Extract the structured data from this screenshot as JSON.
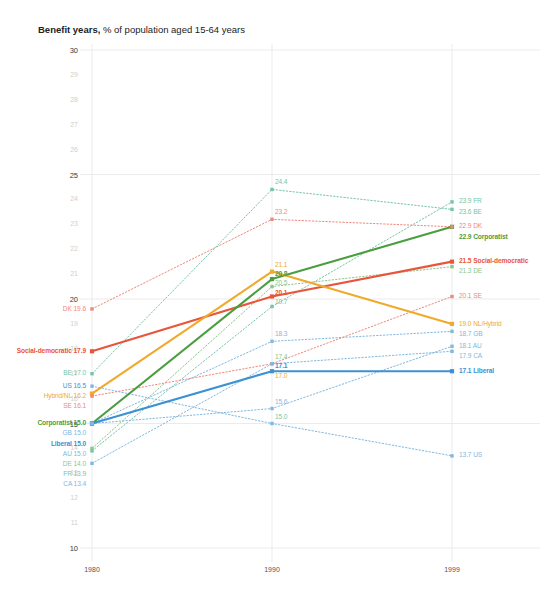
{
  "title": {
    "bold": "Benefit years,",
    "regular": " % of population aged 15-64 years"
  },
  "axes": {
    "x_ticks": [
      "1980",
      "1990",
      "1999"
    ],
    "y_ticks": [
      "30",
      "29",
      "28",
      "27",
      "26",
      "25",
      "24",
      "23",
      "22",
      "21",
      "20",
      "19",
      "18",
      "17",
      "16",
      "15",
      "14",
      "13",
      "12",
      "11",
      "10"
    ],
    "y_major": [
      "30",
      "25",
      "20",
      "15",
      "10"
    ],
    "ylim": [
      10,
      30
    ],
    "xlim": [
      1980,
      1999
    ]
  },
  "colors": {
    "social_democratic": "#e8553a",
    "corporatist": "#4a9e3f",
    "liberal": "#3c90d4",
    "hybrid": "#f0a92b",
    "dk": "#f0877a",
    "se": "#f0877a",
    "de": "#8cc68a",
    "fr": "#76c4a8",
    "be": "#76c4a8",
    "nl": "#f5c06a",
    "gb": "#7fb8e0",
    "au": "#7fb8e0",
    "ca": "#7fb8e0",
    "us": "#7fb8e0",
    "grid": "#e6e6e6",
    "axis_text": "#cfcfcf",
    "axis_text_major": "#3a3a3a"
  },
  "chart_data": {
    "type": "line",
    "title": "Benefit years, % of population aged 15-64 years",
    "xlabel": "",
    "ylabel": "",
    "x": [
      1980,
      1990,
      1999
    ],
    "xlim": [
      1980,
      1999
    ],
    "ylim": [
      10,
      30
    ],
    "grid": true,
    "legend": "inline-labels",
    "series": [
      {
        "name": "Social-democratic",
        "type": "aggregate",
        "color": "#e8553a",
        "style": "solid-bold",
        "values": [
          17.9,
          20.1,
          21.5
        ],
        "label_left": "Social-democratic 17.9",
        "label_mid": "20.1",
        "label_right": "21.5  Social-democratic"
      },
      {
        "name": "Corporatist",
        "type": "aggregate",
        "color": "#4a9e3f",
        "style": "solid-bold",
        "values": [
          15.0,
          20.8,
          22.9
        ],
        "label_left": "Corporatist 15.0",
        "label_mid": "20.8",
        "label_right": "22.9  Corporatist"
      },
      {
        "name": "Liberal",
        "type": "aggregate",
        "color": "#3c90d4",
        "style": "solid-bold",
        "values": [
          15.0,
          17.1,
          17.1
        ],
        "label_left": "Liberal 15.0",
        "label_mid": "17.1",
        "label_right": "17.1  Liberal"
      },
      {
        "name": "Hybrid/NL",
        "type": "aggregate",
        "color": "#f0a92b",
        "style": "solid-bold",
        "values": [
          16.2,
          21.1,
          19.0
        ],
        "label_left": "Hybrid/NL 16.2",
        "label_mid": "21.1",
        "label_right": "19.0 NL/Hybrid"
      },
      {
        "name": "DK",
        "type": "country",
        "color": "#f0877a",
        "style": "dotted",
        "values": [
          19.6,
          23.2,
          22.9
        ],
        "label_left": "DK 19.6",
        "label_mid": "23.2",
        "label_right": "22.9 DK"
      },
      {
        "name": "SE",
        "type": "country",
        "color": "#f0877a",
        "style": "dotted",
        "values": [
          16.1,
          17.4,
          20.1
        ],
        "label_left": "SE 16.1",
        "label_mid": "17.4",
        "label_right": "20.1 SE"
      },
      {
        "name": "BE",
        "type": "country",
        "color": "#76c4a8",
        "style": "dotted",
        "values": [
          17.0,
          24.4,
          23.6
        ],
        "label_left": "BE 17.0",
        "label_mid": "24.4",
        "label_right": "23.6 BE"
      },
      {
        "name": "FR",
        "type": "country",
        "color": "#76c4a8",
        "style": "dotted",
        "values": [
          13.9,
          19.7,
          23.9
        ],
        "label_left": "FR 13.9",
        "label_mid": "19.7",
        "label_right": "23.9 FR"
      },
      {
        "name": "DE",
        "type": "country",
        "color": "#8cc68a",
        "style": "dotted",
        "values": [
          14.0,
          20.5,
          21.3
        ],
        "label_left": "DE 14.0",
        "label_mid": "20.5",
        "label_right": "21.3 DE"
      },
      {
        "name": "NL",
        "type": "country",
        "color": "#f5c06a",
        "style": "dotted",
        "values": [
          16.2,
          21.1,
          19.0
        ],
        "label_left": "NL 16.2",
        "label_mid": "21.1",
        "label_right": "19.0 NL/Hybrid"
      },
      {
        "name": "GB",
        "type": "country",
        "color": "#7fb8e0",
        "style": "dotted",
        "values": [
          15.0,
          18.3,
          18.7
        ],
        "label_left": "GB 15.0",
        "label_mid": "18.3",
        "label_right": "18.7 GB"
      },
      {
        "name": "AU",
        "type": "country",
        "color": "#7fb8e0",
        "style": "dotted",
        "values": [
          15.0,
          15.6,
          18.1
        ],
        "label_left": "AU 15.0",
        "label_mid": "15.6",
        "label_right": "18.1 AU"
      },
      {
        "name": "CA",
        "type": "country",
        "color": "#7fb8e0",
        "style": "dotted",
        "values": [
          13.4,
          17.4,
          17.9
        ],
        "label_left": "CA 13.4",
        "label_mid": "17.4",
        "label_right": "17.9 CA"
      },
      {
        "name": "US",
        "type": "country",
        "color": "#7fb8e0",
        "style": "dotted",
        "values": [
          16.5,
          15.0,
          13.7
        ],
        "label_left": "US 16.5",
        "label_mid": "15.0",
        "label_right": "13.7 US"
      }
    ],
    "left_labels": [
      {
        "text": "DK 19.6",
        "value": 19.6,
        "color": "#f0877a",
        "bold": false
      },
      {
        "text": "Social-democratic 17.9",
        "value": 17.9,
        "color": "#e8553a",
        "bold": true
      },
      {
        "text": "BE 17.0",
        "value": 17.0,
        "color": "#76c4a8",
        "bold": false
      },
      {
        "text": "US 16.5",
        "value": 16.5,
        "color": "#3c90d4",
        "bold": false
      },
      {
        "text": "Hybrid/NL 16.2",
        "value": 16.2,
        "color": "#f0a92b",
        "bold": false
      },
      {
        "text": "SE 16.1",
        "value": 16.1,
        "color": "#f0877a",
        "bold": false
      },
      {
        "text": "Corporatist 15.0",
        "value": 15.0,
        "color": "#4a9e3f",
        "bold": true
      },
      {
        "text": "GB 15.0",
        "value": 15.0,
        "color": "#7fb8e0",
        "bold": false
      },
      {
        "text": "Liberal 15.0",
        "value": 15.0,
        "color": "#3c90d4",
        "bold": true
      },
      {
        "text": "AU 15.0",
        "value": 15.0,
        "color": "#7fb8e0",
        "bold": false
      },
      {
        "text": "DE 14.0",
        "value": 14.0,
        "color": "#8cc68a",
        "bold": false
      },
      {
        "text": "FR 13.9",
        "value": 13.9,
        "color": "#76c4a8",
        "bold": false
      },
      {
        "text": "CA 13.4",
        "value": 13.4,
        "color": "#7fb8e0",
        "bold": false
      }
    ],
    "mid_labels": [
      {
        "text": "24.4",
        "value": 24.4,
        "color": "#76c4a8",
        "bold": false
      },
      {
        "text": "23.2",
        "value": 23.2,
        "color": "#f0877a",
        "bold": false
      },
      {
        "text": "21.1",
        "value": 21.1,
        "color": "#f0a92b",
        "bold": false
      },
      {
        "text": "20.8",
        "value": 20.8,
        "color": "#4a9e3f",
        "bold": true
      },
      {
        "text": "20.5",
        "value": 20.5,
        "color": "#8cc68a",
        "bold": false
      },
      {
        "text": "20.1",
        "value": 20.1,
        "color": "#e8553a",
        "bold": true
      },
      {
        "text": "19.7",
        "value": 19.7,
        "color": "#76c4a8",
        "bold": false
      },
      {
        "text": "18.3",
        "value": 18.3,
        "color": "#7fb8e0",
        "bold": false
      },
      {
        "text": "17.4",
        "value": 17.4,
        "color": "#8cc68a",
        "bold": false
      },
      {
        "text": "17.1",
        "value": 17.1,
        "color": "#3c90d4",
        "bold": true
      },
      {
        "text": "17.0",
        "value": 17.0,
        "color": "#f0a92b",
        "bold": false
      },
      {
        "text": "15.6",
        "value": 15.6,
        "color": "#7fb8e0",
        "bold": false
      },
      {
        "text": "15.0",
        "value": 15.0,
        "color": "#76c4a8",
        "bold": false
      }
    ],
    "right_labels": [
      {
        "text": "23.9 FR",
        "value": 23.9,
        "color": "#76c4a8",
        "bold": false
      },
      {
        "text": "23.6 BE",
        "value": 23.6,
        "color": "#76c4a8",
        "bold": false
      },
      {
        "text": "22.9 DK",
        "value": 22.9,
        "color": "#f0877a",
        "bold": false
      },
      {
        "text": "22.9  Corporatist",
        "value": 22.6,
        "color": "#4a9e3f",
        "bold": true
      },
      {
        "text": "21.5  Social-democratic",
        "value": 21.5,
        "color": "#e8553a",
        "bold": true
      },
      {
        "text": "21.3 DE",
        "value": 21.3,
        "color": "#8cc68a",
        "bold": false
      },
      {
        "text": "20.1 SE",
        "value": 20.1,
        "color": "#f0877a",
        "bold": false
      },
      {
        "text": "19.0 NL/Hybrid",
        "value": 19.0,
        "color": "#f0a92b",
        "bold": false
      },
      {
        "text": "18.7 GB",
        "value": 18.7,
        "color": "#7fb8e0",
        "bold": false
      },
      {
        "text": "18.1 AU",
        "value": 18.1,
        "color": "#7fb8e0",
        "bold": false
      },
      {
        "text": "17.9 CA",
        "value": 17.9,
        "color": "#7fb8e0",
        "bold": false
      },
      {
        "text": "17.1  Liberal",
        "value": 17.1,
        "color": "#3c90d4",
        "bold": true
      },
      {
        "text": "13.7 US",
        "value": 13.7,
        "color": "#7fb8e0",
        "bold": false
      }
    ]
  }
}
